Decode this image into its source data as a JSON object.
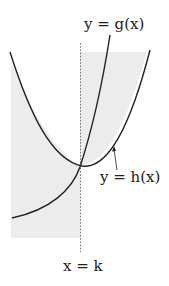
{
  "figure": {
    "type": "function-region-diagram",
    "curves": [
      {
        "name": "g",
        "label": "y = g(x)",
        "shape": "increasing convex curve"
      },
      {
        "name": "h",
        "label": "y = h(x)",
        "shape": "upward parabola"
      }
    ],
    "vertical_line": {
      "label": "x = k",
      "style": "dashed"
    },
    "labels": {
      "g": "y = g(x)",
      "h": "y = h(x)",
      "k": "x = k"
    },
    "colors": {
      "curve": "#222222",
      "shading": "#ececec",
      "dashed_line": "#555555"
    }
  }
}
